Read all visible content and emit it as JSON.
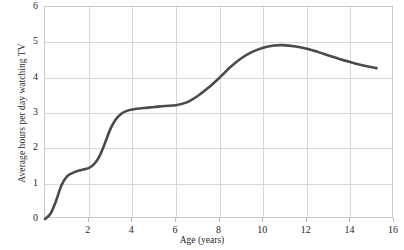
{
  "chart_data": {
    "type": "line",
    "title": "",
    "xlabel": "Age (years)",
    "ylabel": "Average hours per day watching TV",
    "xlim": [
      0,
      16
    ],
    "ylim": [
      0,
      6
    ],
    "grid": true,
    "legend": false,
    "legend_position": "none",
    "xticks": [
      2,
      4,
      6,
      8,
      10,
      12,
      14,
      16
    ],
    "xtick_labels": [
      "2",
      "4",
      "6",
      "8",
      "10",
      "12",
      "14",
      "16"
    ],
    "yticks": [
      0,
      1,
      2,
      3,
      4,
      5,
      6
    ],
    "ytick_labels": [
      "0",
      "1",
      "2",
      "3",
      "4",
      "5",
      "6"
    ],
    "line_color": "#4a4a4a",
    "line_width": 2.6,
    "series": [
      {
        "name": "Average hours per day watching TV",
        "x": [
          0.0,
          0.25,
          0.5,
          0.75,
          1.0,
          1.25,
          1.5,
          1.75,
          2.0,
          2.25,
          2.5,
          2.75,
          3.0,
          3.25,
          3.5,
          3.75,
          4.0,
          4.5,
          5.0,
          5.5,
          6.0,
          6.5,
          7.0,
          7.5,
          8.0,
          8.5,
          9.0,
          9.5,
          10.0,
          10.5,
          10.9,
          11.5,
          12.0,
          12.5,
          13.0,
          13.5,
          14.0,
          14.5,
          15.2
        ],
        "y": [
          0.0,
          0.15,
          0.5,
          0.95,
          1.2,
          1.3,
          1.36,
          1.4,
          1.44,
          1.55,
          1.78,
          2.15,
          2.55,
          2.82,
          2.98,
          3.06,
          3.1,
          3.14,
          3.17,
          3.2,
          3.22,
          3.3,
          3.48,
          3.72,
          4.0,
          4.3,
          4.55,
          4.73,
          4.85,
          4.91,
          4.92,
          4.88,
          4.82,
          4.73,
          4.63,
          4.53,
          4.44,
          4.36,
          4.27
        ]
      }
    ]
  },
  "axes": {
    "y_title": "Average hours per day watching TV",
    "x_title": "Age (years)"
  }
}
